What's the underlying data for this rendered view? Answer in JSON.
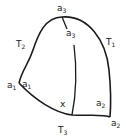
{
  "diagram": {
    "stroke_color": "#1a1a1a",
    "vertices": {
      "top": {
        "base": "a",
        "sub": "3"
      },
      "left": {
        "base": "a",
        "sub": "1"
      },
      "bottom_right": {
        "base": "a",
        "sub": "2"
      }
    },
    "inner_labels": {
      "top_inner": {
        "base": "a",
        "sub": "3"
      },
      "left_inner": {
        "base": "a",
        "sub": "1"
      },
      "right_inner": {
        "base": "a",
        "sub": "2"
      },
      "point": "x"
    },
    "sides": {
      "right": {
        "base": "T",
        "sub": "1"
      },
      "left": {
        "base": "T",
        "sub": "2"
      },
      "bottom": {
        "base": "T",
        "sub": "3"
      }
    }
  }
}
